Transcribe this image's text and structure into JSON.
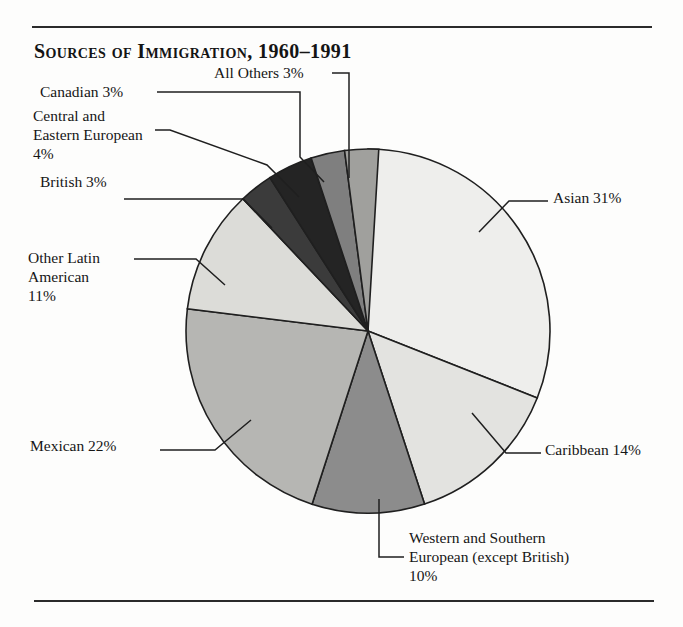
{
  "figure": {
    "title": "Sources of Immigration, 1960–1991",
    "has_top_rule": true,
    "has_bottom_rule": true,
    "rule_color": "#2b2b2b"
  },
  "chart_data": {
    "type": "pie",
    "title": "Sources of Immigration, 1960–1991",
    "xlabel": "",
    "ylabel": "",
    "units": "percent",
    "start_angle_deg": 0,
    "direction": "clockwise",
    "total": 101,
    "categories": [
      "Asian",
      "Caribbean",
      "Western and Southern European (except British)",
      "Mexican",
      "Other Latin American",
      "British",
      "Central and Eastern European",
      "Canadian",
      "All Others"
    ],
    "values": [
      31,
      14,
      10,
      22,
      11,
      3,
      4,
      3,
      3
    ],
    "slices": [
      {
        "key": "asian",
        "label": "Asian 31%",
        "name": "Asian",
        "value": 31,
        "value_text": "31%",
        "color": "#eeeeec",
        "start_deg": 0,
        "end_deg": 111.6
      },
      {
        "key": "caribbean",
        "label": "Caribbean 14%",
        "name": "Caribbean",
        "value": 14,
        "value_text": "14%",
        "color": "#e3e3e0",
        "start_deg": 111.6,
        "end_deg": 161.9
      },
      {
        "key": "western-southern-european",
        "label": "Western and Southern\nEuropean (except British)\n10%",
        "name": "Western and Southern European (except British)",
        "value": 10,
        "value_text": "10%",
        "color": "#8c8c8c",
        "start_deg": 161.9,
        "end_deg": 197.9
      },
      {
        "key": "mexican",
        "label": "Mexican 22%",
        "name": "Mexican",
        "value": 22,
        "value_text": "22%",
        "color": "#b6b6b3",
        "start_deg": 197.9,
        "end_deg": 277.0
      },
      {
        "key": "other-latin-american",
        "label": "Other Latin\nAmerican\n11%",
        "name": "Other Latin American",
        "value": 11,
        "value_text": "11%",
        "color": "#dcdcd8",
        "start_deg": 277.0,
        "end_deg": 316.6
      },
      {
        "key": "british",
        "label": "British 3%",
        "name": "British",
        "value": 3,
        "value_text": "3%",
        "color": "#3b3b3b",
        "start_deg": 316.6,
        "end_deg": 327.4
      },
      {
        "key": "central-eastern-european",
        "label": "Central and\nEastern European\n4%",
        "name": "Central and Eastern European",
        "value": 4,
        "value_text": "4%",
        "color": "#242424",
        "start_deg": 327.4,
        "end_deg": 341.8
      },
      {
        "key": "canadian",
        "label": "Canadian 3%",
        "name": "Canadian",
        "value": 3,
        "value_text": "3%",
        "color": "#7f7f7f",
        "start_deg": 341.8,
        "end_deg": 352.6
      },
      {
        "key": "all-others",
        "label": "All Others 3%",
        "name": "All Others",
        "value": 3,
        "value_text": "3%",
        "color": "#a0a09d",
        "start_deg": 352.6,
        "end_deg": 363.4
      }
    ],
    "geometry": {
      "cx": 368,
      "cy": 331,
      "r": 182
    },
    "legend": "none",
    "grid": false
  }
}
